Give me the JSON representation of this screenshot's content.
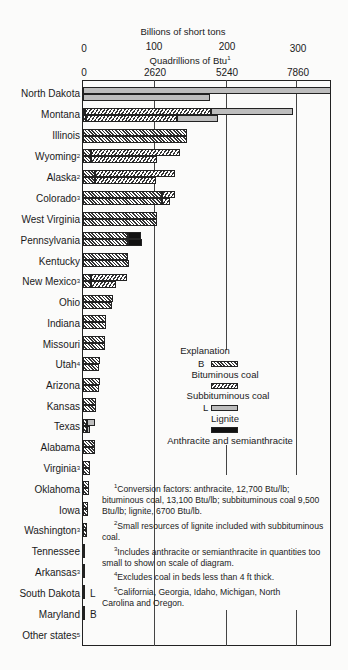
{
  "chart_data": {
    "type": "bar",
    "orientation": "horizontal",
    "title": "",
    "x_axis_top": {
      "label": "Billions of short tons",
      "ticks": [
        "0",
        "100",
        "200",
        "300"
      ],
      "range": [
        0,
        350
      ]
    },
    "x_axis_bottom": {
      "label": "Quadrillions of Btu",
      "label_footnote": "1",
      "ticks": [
        "0",
        "2620",
        "5240",
        "7860"
      ],
      "range": [
        0,
        9170
      ]
    },
    "grid": true,
    "stacked": true,
    "legend_title": "Explanation",
    "legend": [
      {
        "key": "bituminous",
        "label": "Bituminous coal",
        "prefix": "B",
        "pattern": "dense-diagonal-hatch"
      },
      {
        "key": "subbituminous",
        "label": "Subbituminous coal",
        "prefix": "",
        "pattern": "wide-diagonal-hatch"
      },
      {
        "key": "lignite",
        "label": "Lignite",
        "prefix": "L",
        "pattern": "light-gray-stipple"
      },
      {
        "key": "anthracite",
        "label": "Anthracite and semianthracite",
        "prefix": "",
        "pattern": "solid-black"
      }
    ],
    "categories": [
      "North Dakota",
      "Montana",
      "Illinois",
      "Wyoming",
      "Alaska",
      "Colorado",
      "West Virginia",
      "Pennsylvania",
      "Kentucky",
      "New Mexico",
      "Ohio",
      "Indiana",
      "Missouri",
      "Utah",
      "Arizona",
      "Kansas",
      "Texas",
      "Alabama",
      "Virginia",
      "Oklahoma",
      "Iowa",
      "Washington",
      "Tennessee",
      "Arkansas",
      "South Dakota",
      "Maryland",
      "Other states"
    ],
    "category_footnotes": {
      "Wyoming": "2",
      "Alaska": "2",
      "Colorado": "3",
      "New Mexico": "3",
      "Utah": "4",
      "Virginia": "3",
      "Washington": "3",
      "Arkansas": "3",
      "Other states": "5"
    },
    "series_tons": [
      {
        "name": "Bituminous",
        "values": [
          0,
          1,
          145,
          11,
          17,
          110,
          103,
          63,
          63,
          11,
          41,
          32,
          30,
          23,
          23,
          18,
          5,
          16,
          10,
          8,
          7,
          6,
          3,
          3,
          0,
          1,
          0
        ]
      },
      {
        "name": "Subbituminous",
        "values": [
          0,
          175,
          0,
          124,
          111,
          18,
          0,
          0,
          0,
          50,
          0,
          0,
          0,
          0,
          0,
          0,
          0,
          0,
          0,
          0,
          0,
          0,
          0,
          0,
          0,
          0,
          0
        ]
      },
      {
        "name": "Lignite",
        "values": [
          350,
          114,
          0,
          0,
          0,
          0,
          0,
          0,
          0,
          0,
          0,
          0,
          0,
          0,
          0,
          0,
          11,
          0,
          0,
          0,
          0,
          0,
          0,
          0,
          2,
          0,
          0
        ]
      },
      {
        "name": "Anthracite and semianthracite",
        "values": [
          0,
          0,
          0,
          0,
          0,
          0,
          0,
          18,
          0,
          0,
          0,
          0,
          0,
          0,
          0,
          0,
          0,
          0,
          0,
          0,
          0,
          0,
          0,
          0,
          0,
          0,
          0
        ]
      }
    ],
    "series_btu": [
      {
        "name": "Bituminous",
        "values": [
          0,
          100,
          3800,
          290,
          430,
          2880,
          2700,
          1650,
          1660,
          290,
          1070,
          840,
          790,
          600,
          600,
          480,
          130,
          420,
          260,
          210,
          180,
          160,
          80,
          80,
          0,
          30,
          0
        ]
      },
      {
        "name": "Subbituminous",
        "values": [
          0,
          3330,
          0,
          2420,
          2240,
          290,
          0,
          0,
          0,
          910,
          0,
          0,
          0,
          0,
          0,
          0,
          0,
          0,
          0,
          0,
          0,
          0,
          0,
          0,
          0,
          0,
          0
        ]
      },
      {
        "name": "Lignite",
        "values": [
          4620,
          1470,
          0,
          0,
          0,
          0,
          0,
          0,
          0,
          0,
          0,
          0,
          0,
          0,
          0,
          0,
          130,
          0,
          0,
          0,
          0,
          0,
          0,
          0,
          30,
          0,
          0
        ]
      },
      {
        "name": "Anthracite and semianthracite",
        "values": [
          0,
          0,
          0,
          0,
          0,
          0,
          0,
          480,
          0,
          0,
          0,
          0,
          0,
          0,
          0,
          0,
          0,
          0,
          0,
          0,
          0,
          0,
          0,
          0,
          0,
          0,
          0
        ]
      }
    ],
    "inline_tags": {
      "South Dakota": "L",
      "Maryland": "B"
    }
  },
  "axes": {
    "top_title": "Billions of short tons",
    "top_ticks": [
      "0",
      "100",
      "200",
      "300"
    ],
    "bottom_title": "Quadrillions of Btu",
    "bottom_title_sup": "1",
    "bottom_ticks": [
      "0",
      "2620",
      "5240",
      "7860"
    ]
  },
  "states": [
    {
      "name": "North Dakota",
      "sup": ""
    },
    {
      "name": "Montana",
      "sup": ""
    },
    {
      "name": "Illinois",
      "sup": ""
    },
    {
      "name": "Wyoming",
      "sup": "2"
    },
    {
      "name": "Alaska",
      "sup": "2"
    },
    {
      "name": "Colorado",
      "sup": "3"
    },
    {
      "name": "West Virginia",
      "sup": ""
    },
    {
      "name": "Pennsylvania",
      "sup": ""
    },
    {
      "name": "Kentucky",
      "sup": ""
    },
    {
      "name": "New Mexico",
      "sup": "3"
    },
    {
      "name": "Ohio",
      "sup": ""
    },
    {
      "name": "Indiana",
      "sup": ""
    },
    {
      "name": "Missouri",
      "sup": ""
    },
    {
      "name": "Utah",
      "sup": "4"
    },
    {
      "name": "Arizona",
      "sup": ""
    },
    {
      "name": "Kansas",
      "sup": ""
    },
    {
      "name": "Texas",
      "sup": ""
    },
    {
      "name": "Alabama",
      "sup": ""
    },
    {
      "name": "Virginia",
      "sup": "3"
    },
    {
      "name": "Oklahoma",
      "sup": ""
    },
    {
      "name": "Iowa",
      "sup": ""
    },
    {
      "name": "Washington",
      "sup": "3"
    },
    {
      "name": "Tennessee",
      "sup": ""
    },
    {
      "name": "Arkansas",
      "sup": "3"
    },
    {
      "name": "South Dakota",
      "sup": ""
    },
    {
      "name": "Maryland",
      "sup": ""
    },
    {
      "name": "Other states",
      "sup": "5"
    }
  ],
  "tags": {
    "south_dakota": "L",
    "maryland": "B"
  },
  "legend": {
    "title": "Explanation",
    "b_prefix": "B",
    "bituminous": "Bituminous coal",
    "subbituminous": "Subbituminous coal",
    "l_prefix": "L",
    "lignite": "Lignite",
    "anthracite": "Anthracite and semianthracite"
  },
  "notes": [
    {
      "sup": "1",
      "text": "Conversion factors: anthracite, 12,700 Btu/lb; bituminous coal, 13,100 Btu/lb; subbituminous coal 9,500 Btu/lb; lignite, 6700 Btu/lb."
    },
    {
      "sup": "2",
      "text": "Small resources of lignite included with subbituminous coal."
    },
    {
      "sup": "3",
      "text": "Includes anthracite or semianthracite in quantities too small to show on scale of diagram."
    },
    {
      "sup": "4",
      "text": "Excludes coal in beds less than 4 ft thick."
    },
    {
      "sup": "5",
      "text": "California, Georgia, Idaho, Michigan, North Carolina and Oregon."
    }
  ]
}
